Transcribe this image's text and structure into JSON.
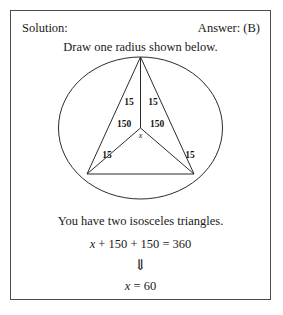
{
  "header": {
    "solution_label": "Solution:",
    "answer_label": "Answer: (B)"
  },
  "instruction": "Draw one radius shown below.",
  "diagram": {
    "circle_label": "circle",
    "labels": {
      "top_left_15": "15",
      "top_right_15": "15",
      "center_left_150": "150",
      "center_right_150": "150",
      "center_x": "x",
      "bottom_left_15": "15",
      "bottom_right_15": "15"
    },
    "stroke_color": "#2b2b2b"
  },
  "conclusion": "You have two isosceles triangles.",
  "equation": {
    "unknown": "x",
    "line1_rest": " + 150 + 150 = 360",
    "implies_arrow": "⇓",
    "line2_rest": " = 60"
  }
}
